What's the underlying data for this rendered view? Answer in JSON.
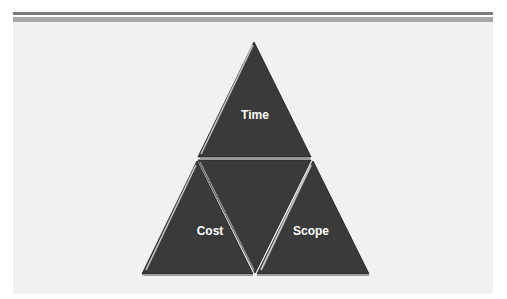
{
  "diagram": {
    "type": "triangle-constraint",
    "title": "",
    "segments": [
      {
        "id": "top",
        "label": "Time"
      },
      {
        "id": "bottom-left",
        "label": "Cost"
      },
      {
        "id": "bottom-right",
        "label": "Scope"
      },
      {
        "id": "center",
        "label": ""
      }
    ],
    "colors": {
      "fill": "#3a3a3a",
      "edge_highlight": "#bdbdbd",
      "background": "#f1f1f1",
      "rule_dark": "#7a7a7a",
      "rule_light": "#a8a8a8",
      "label": "#ffffff"
    }
  }
}
